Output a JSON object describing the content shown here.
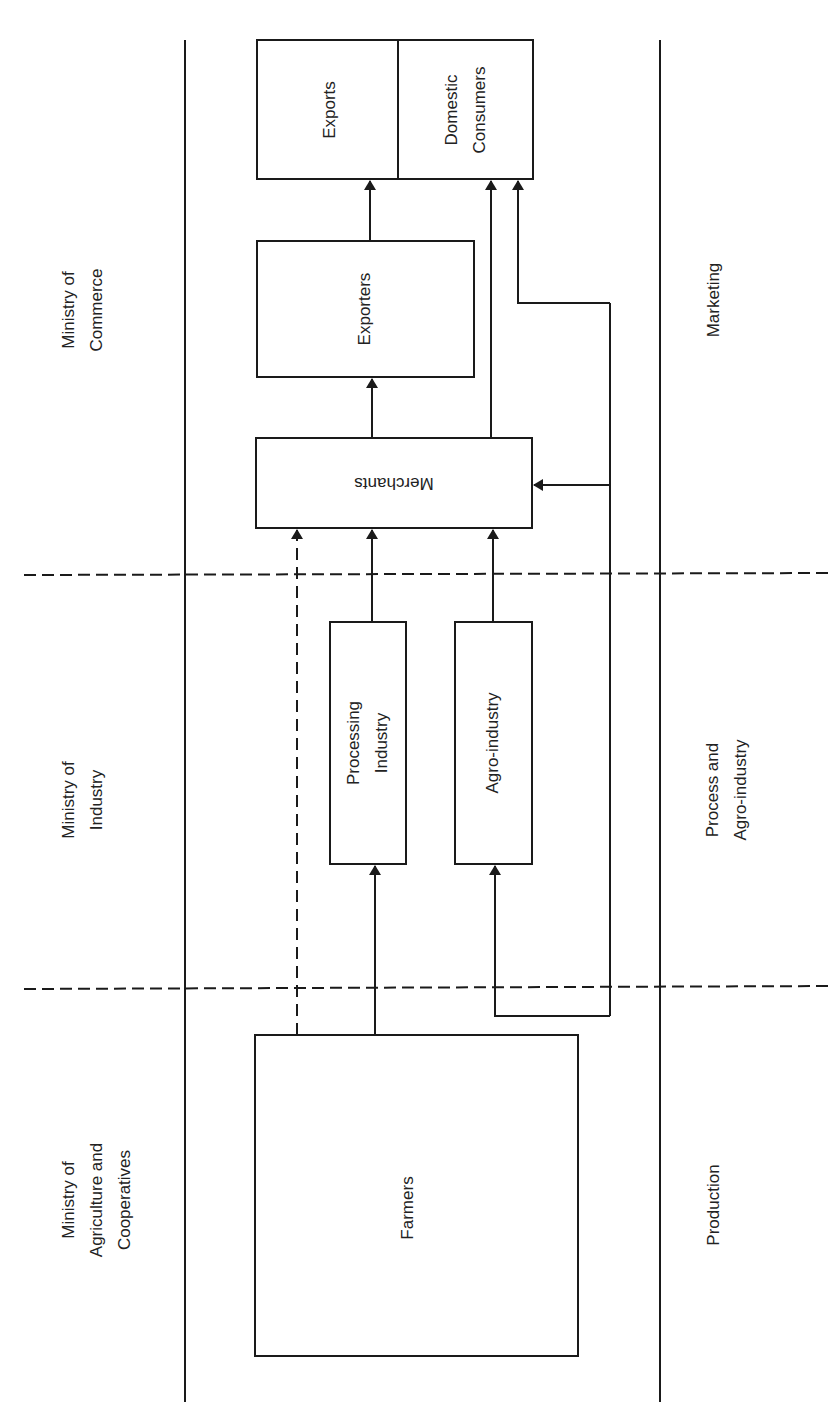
{
  "diagram": {
    "type": "flowchart",
    "orientation": "rotated-90-ccw",
    "colors": {
      "line": "#1a1a1a",
      "background": "#ffffff"
    },
    "ministries": [
      {
        "id": "commerce",
        "label": "Ministry of\nCommerce"
      },
      {
        "id": "industry",
        "label": "Ministry of\nIndustry"
      },
      {
        "id": "agriculture",
        "label": "Ministry of\nAgriculture and\nCooperatives"
      }
    ],
    "stages": [
      {
        "id": "marketing",
        "label": "Marketing"
      },
      {
        "id": "process",
        "label": "Process and\nAgro-industry"
      },
      {
        "id": "production",
        "label": "Production"
      }
    ],
    "nodes": {
      "exports": "Exports",
      "domestic_consumers": "Domestic\nConsumers",
      "exporters": "Exporters",
      "merchants": "Merchants",
      "processing_industry": "Processing\nIndustry",
      "agro_industry": "Agro-industry",
      "farmers": "Farmers"
    },
    "edges": [
      {
        "from": "Farmers",
        "to": "Merchants",
        "style": "dashed"
      },
      {
        "from": "Farmers",
        "to": "Processing Industry",
        "style": "solid"
      },
      {
        "from": "Farmers",
        "to": "Merchants",
        "style": "solid",
        "via": "right loop"
      },
      {
        "from": "Farmers",
        "to": "Agro-industry",
        "style": "solid",
        "via": "right loop"
      },
      {
        "from": "Farmers",
        "to": "Domestic Consumers",
        "style": "solid",
        "via": "right loop"
      },
      {
        "from": "Processing Industry",
        "to": "Merchants",
        "style": "solid"
      },
      {
        "from": "Agro-industry",
        "to": "Merchants",
        "style": "solid"
      },
      {
        "from": "Merchants",
        "to": "Exporters",
        "style": "solid"
      },
      {
        "from": "Merchants",
        "to": "Domestic Consumers",
        "style": "solid"
      },
      {
        "from": "Exporters",
        "to": "Exports",
        "style": "solid"
      }
    ]
  }
}
